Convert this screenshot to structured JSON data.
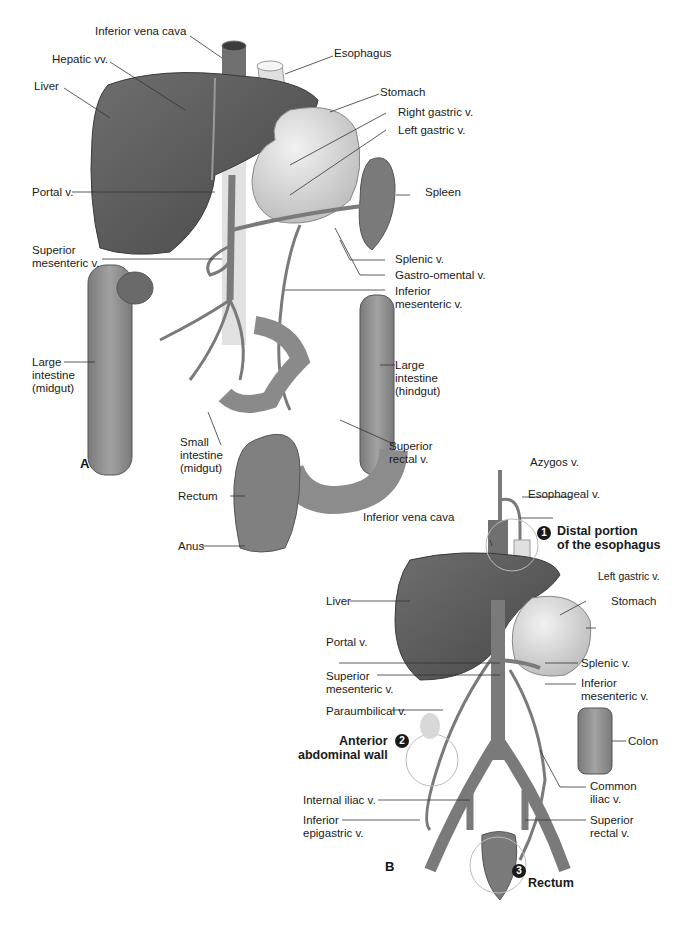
{
  "panel_a": {
    "letter": "A",
    "labels": {
      "ivc": "Inferior vena cava",
      "hepatic": "Hepatic vv.",
      "liver": "Liver",
      "esophagus": "Esophagus",
      "stomach": "Stomach",
      "right_gastric": "Right gastric v.",
      "left_gastric": "Left gastric v.",
      "portal": "Portal v.",
      "spleen": "Spleen",
      "sup_mes_1": "Superior",
      "sup_mes_2": "mesenteric v.",
      "splenic": "Splenic v.",
      "gastro_omental": "Gastro-omental v.",
      "inf_mes_1": "Inferior",
      "inf_mes_2": "mesenteric v.",
      "large_mid_1": "Large",
      "large_mid_2": "intestine",
      "large_mid_3": "(midgut)",
      "large_hind_1": "Large",
      "large_hind_2": "intestine",
      "large_hind_3": "(hindgut)",
      "small_1": "Small",
      "small_2": "intestine",
      "small_3": "(midgut)",
      "sup_rectal_1": "Superior",
      "sup_rectal_2": "rectal v.",
      "rectum": "Rectum",
      "anus": "Anus"
    }
  },
  "panel_b": {
    "letter": "B",
    "labels": {
      "azygos": "Azygos v.",
      "esophageal": "Esophageal v.",
      "ivc": "Inferior vena cava",
      "site1_num": "1",
      "site1_1": "Distal portion",
      "site1_2": "of the esophagus",
      "liver": "Liver",
      "left_gastric": "Left gastric v.",
      "stomach": "Stomach",
      "portal": "Portal v.",
      "splenic": "Splenic v.",
      "sup_mes_1": "Superior",
      "sup_mes_2": "mesenteric v.",
      "inf_mes_1": "Inferior",
      "inf_mes_2": "mesenteric v.",
      "paraumbilical": "Paraumbilical v.",
      "site2_num": "2",
      "site2_1": "Anterior",
      "site2_2": "abdominal wall",
      "colon": "Colon",
      "internal_iliac": "Internal iliac v.",
      "common_iliac_1": "Common",
      "common_iliac_2": "iliac v.",
      "inf_epi_1": "Inferior",
      "inf_epi_2": "epigastric v.",
      "sup_rectal_1": "Superior",
      "sup_rectal_2": "rectal v.",
      "site3_num": "3",
      "site3": "Rectum"
    }
  },
  "colors": {
    "liver": "#5a5a5a",
    "vein": "#7a7a7a",
    "stomach": "#dcdcdc",
    "intestine": "#8c8c8c",
    "leader": "#333333"
  }
}
